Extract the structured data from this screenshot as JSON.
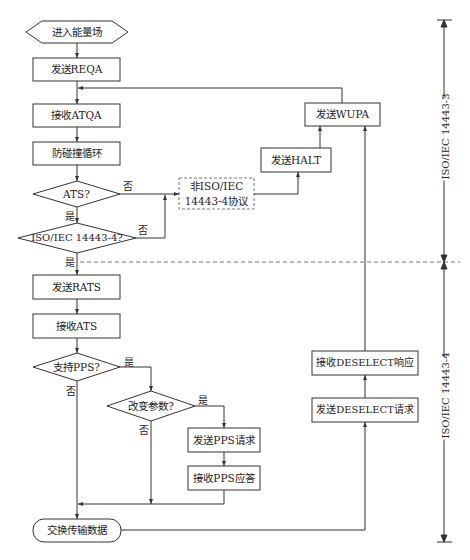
{
  "nodes": {
    "start": "进入能量场",
    "send_reqa": "发送REQA",
    "recv_atqa": "接收ATQA",
    "anticollision": "防碰撞循环",
    "ats_decision": "ATS?",
    "iso_decision": "ISO/IEC 14443-4?",
    "non_iso_line1": "非ISO/IEC",
    "non_iso_line2": "14443-4协议",
    "send_halt": "发送HALT",
    "send_wupa": "发送WUPA",
    "send_rats": "发送RATS",
    "recv_ats": "接收ATS",
    "pps_support": "支持PPS?",
    "change_params": "改变参数?",
    "send_pps_req": "发送PPS请求",
    "recv_pps_resp": "接收PPS应答",
    "exchange_data": "交换传输数据",
    "send_deselect": "发送DESELECT请求",
    "recv_deselect": "接收DESELECT响应"
  },
  "edge_labels": {
    "yes": "是",
    "no": "否"
  },
  "dimension_labels": {
    "upper": "ISO/IEC 14443-3",
    "lower": "ISO/IEC 14443-4"
  },
  "colors": {
    "stroke": "#333333",
    "dash": "#777777",
    "background": "#ffffff"
  }
}
